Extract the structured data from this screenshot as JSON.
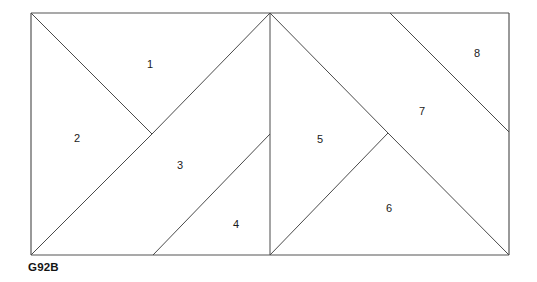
{
  "figure": {
    "caption": "G92B",
    "caption_position": {
      "x": 28,
      "y": 262
    },
    "stroke_color": "#4a4a4a",
    "outline_color": "#555555",
    "background_color": "#ffffff",
    "label_color": "#1a1a1a",
    "outer_rectangle": {
      "x": 31,
      "y": 13,
      "width": 478,
      "height": 242
    },
    "regions": [
      {
        "id": "region-1",
        "label": "1",
        "x": 150,
        "y": 64
      },
      {
        "id": "region-2",
        "label": "2",
        "x": 77,
        "y": 138
      },
      {
        "id": "region-3",
        "label": "3",
        "x": 180,
        "y": 165
      },
      {
        "id": "region-4",
        "label": "4",
        "x": 236,
        "y": 224
      },
      {
        "id": "region-5",
        "label": "5",
        "x": 320,
        "y": 139
      },
      {
        "id": "region-6",
        "label": "6",
        "x": 389,
        "y": 208
      },
      {
        "id": "region-7",
        "label": "7",
        "x": 422,
        "y": 111
      },
      {
        "id": "region-8",
        "label": "8",
        "x": 477,
        "y": 53
      }
    ],
    "segments": [
      {
        "name": "outline-top",
        "x1": 31,
        "y1": 13,
        "x2": 509,
        "y2": 13
      },
      {
        "name": "outline-right",
        "x1": 509,
        "y1": 13,
        "x2": 509,
        "y2": 255
      },
      {
        "name": "outline-bottom",
        "x1": 509,
        "y1": 255,
        "x2": 31,
        "y2": 255
      },
      {
        "name": "outline-left",
        "x1": 31,
        "y1": 255,
        "x2": 31,
        "y2": 13
      },
      {
        "name": "divider-middle-vertical",
        "x1": 270,
        "y1": 13,
        "x2": 270,
        "y2": 255
      },
      {
        "name": "cut-1-2",
        "x1": 31,
        "y1": 13,
        "x2": 152,
        "y2": 134
      },
      {
        "name": "cut-1-3",
        "x1": 152,
        "y1": 134,
        "x2": 270,
        "y2": 13
      },
      {
        "name": "cut-2-3",
        "x1": 31,
        "y1": 255,
        "x2": 152,
        "y2": 134
      },
      {
        "name": "cut-3-4",
        "x1": 153,
        "y1": 255,
        "x2": 270,
        "y2": 134
      },
      {
        "name": "cut-5-7",
        "x1": 270,
        "y1": 13,
        "x2": 388,
        "y2": 133
      },
      {
        "name": "cut-6-7",
        "x1": 388,
        "y1": 133,
        "x2": 509,
        "y2": 255
      },
      {
        "name": "cut-5-6",
        "x1": 270,
        "y1": 255,
        "x2": 388,
        "y2": 133
      },
      {
        "name": "cut-7-8",
        "x1": 390,
        "y1": 13,
        "x2": 509,
        "y2": 132
      }
    ]
  }
}
